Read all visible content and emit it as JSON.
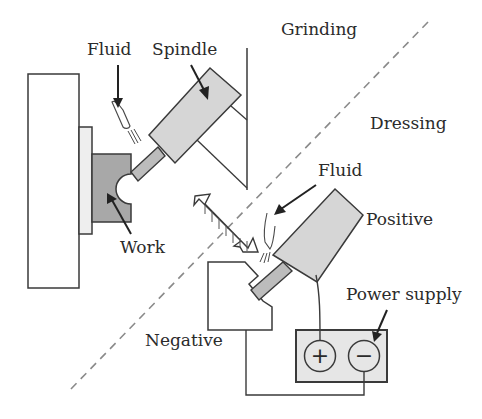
{
  "figure": {
    "regions": {
      "grinding": "Grinding",
      "dressing": "Dressing"
    },
    "labels": {
      "fluid_top": "Fluid",
      "spindle": "Spindle",
      "work": "Work",
      "fluid_bottom": "Fluid",
      "positive": "Positive",
      "negative": "Negative",
      "power_supply": "Power supply"
    },
    "power_supply": {
      "positive_terminal": "+",
      "negative_terminal": "−"
    },
    "colors": {
      "line": "#3a3a3a",
      "spindle_fill": "#d6d6d6",
      "work_fill": "#a8a8a8",
      "plate_fill": "#eeeeee",
      "supply_fill": "#e6e6e6",
      "shaft_fill": "#bcbcbc",
      "dashed": "#8a8a8a"
    }
  }
}
